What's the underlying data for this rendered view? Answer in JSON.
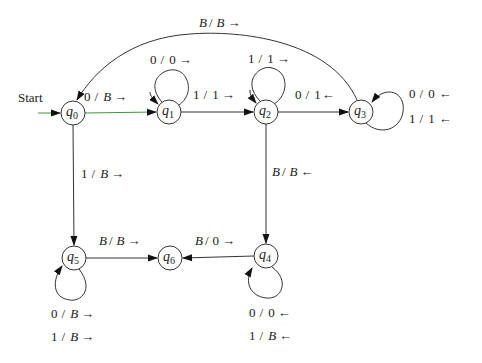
{
  "diagram": {
    "type": "turing-machine-state-diagram",
    "start_label": "Start",
    "states": [
      {
        "id": "q0",
        "name": "q",
        "sub": "0",
        "x": 73,
        "y": 113
      },
      {
        "id": "q1",
        "name": "q",
        "sub": "1",
        "x": 169,
        "y": 112
      },
      {
        "id": "q2",
        "name": "q",
        "sub": "2",
        "x": 266,
        "y": 112
      },
      {
        "id": "q3",
        "name": "q",
        "sub": "3",
        "x": 361,
        "y": 112
      },
      {
        "id": "q4",
        "name": "q",
        "sub": "4",
        "x": 266,
        "y": 256
      },
      {
        "id": "q5",
        "name": "q",
        "sub": "5",
        "x": 74,
        "y": 258
      },
      {
        "id": "q6",
        "name": "q",
        "sub": "6",
        "x": 170,
        "y": 258
      }
    ],
    "transitions": [
      {
        "from": "q0",
        "to": "q1",
        "label": "0 / B →"
      },
      {
        "from": "q1",
        "to": "q1",
        "label": "0 / 0 →"
      },
      {
        "from": "q1",
        "to": "q2",
        "label": "1 / 1 →"
      },
      {
        "from": "q2",
        "to": "q2",
        "label": "1 / 1 →"
      },
      {
        "from": "q2",
        "to": "q3",
        "label": "0 / 1 ←"
      },
      {
        "from": "q3",
        "to": "q3",
        "label": "0 / 0 ←"
      },
      {
        "from": "q3",
        "to": "q3",
        "label": "1 / 1 ←"
      },
      {
        "from": "q3",
        "to": "q0",
        "label": "B / B →"
      },
      {
        "from": "q0",
        "to": "q5",
        "label": "1 / B →"
      },
      {
        "from": "q2",
        "to": "q4",
        "label": "B / B ←"
      },
      {
        "from": "q5",
        "to": "q5",
        "label": "0 / B →"
      },
      {
        "from": "q5",
        "to": "q5",
        "label": "1 / B →"
      },
      {
        "from": "q5",
        "to": "q6",
        "label": "B / B →"
      },
      {
        "from": "q4",
        "to": "q6",
        "label": "B / 0 →"
      },
      {
        "from": "q4",
        "to": "q4",
        "label": "0 / 0 ←"
      },
      {
        "from": "q4",
        "to": "q4",
        "label": "1 / B ←"
      }
    ],
    "labels": {
      "q0_q1": {
        "a": "0",
        "b": "B",
        "dir": "→"
      },
      "q1_loop": {
        "a": "0",
        "b": "0",
        "dir": "→"
      },
      "q1_q2": {
        "a": "1",
        "b": "1",
        "dir": "→"
      },
      "q2_loop": {
        "a": "1",
        "b": "1",
        "dir": "→"
      },
      "q2_q3": {
        "a": "0",
        "b": "1",
        "dir": "←"
      },
      "q3_loop_a": {
        "a": "0",
        "b": "0",
        "dir": "←"
      },
      "q3_loop_b": {
        "a": "1",
        "b": "1",
        "dir": "←"
      },
      "q3_q0": {
        "a": "B",
        "b": "B",
        "dir": "→"
      },
      "q0_q5": {
        "a": "1",
        "b": "B",
        "dir": "→"
      },
      "q2_q4": {
        "a": "B",
        "b": "B",
        "dir": "←"
      },
      "q5_loop_a": {
        "a": "0",
        "b": "B",
        "dir": "→"
      },
      "q5_loop_b": {
        "a": "1",
        "b": "B",
        "dir": "→"
      },
      "q5_q6": {
        "a": "B",
        "b": "B",
        "dir": "→"
      },
      "q4_q6": {
        "a": "B",
        "b": "0",
        "dir": "→"
      },
      "q4_loop_a": {
        "a": "0",
        "b": "0",
        "dir": "←"
      },
      "q4_loop_b": {
        "a": "1",
        "b": "B",
        "dir": "←"
      }
    },
    "separator": "/",
    "colors": {
      "stroke": "#333333",
      "start_edge": "#3a9a3a",
      "text": "#1a1a1a",
      "background": "#ffffff"
    }
  }
}
